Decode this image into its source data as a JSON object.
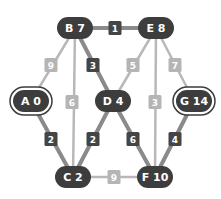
{
  "colors": {
    "node_fill": "#3d3d3d",
    "node_text": "#ffffff",
    "edge_light": "#b8b8b8",
    "edge_dark": "#8a8a8a",
    "weight_light_fill": "#b5b5b5",
    "weight_dark_fill": "#454545",
    "background": "#ffffff"
  },
  "nodes": [
    {
      "id": "B",
      "label": "B 7",
      "x": 75,
      "y": 28,
      "w": 36,
      "special": false
    },
    {
      "id": "E",
      "label": "E 8",
      "x": 156,
      "y": 28,
      "w": 36,
      "special": false
    },
    {
      "id": "A",
      "label": "A 0",
      "x": 31,
      "y": 101,
      "w": 36,
      "special": true
    },
    {
      "id": "D",
      "label": "D 4",
      "x": 113,
      "y": 101,
      "w": 36,
      "special": false
    },
    {
      "id": "G",
      "label": "G 14",
      "x": 194,
      "y": 101,
      "w": 36,
      "special": true
    },
    {
      "id": "C",
      "label": "C 2",
      "x": 73,
      "y": 177,
      "w": 36,
      "special": false
    },
    {
      "id": "F",
      "label": "F 10",
      "x": 155,
      "y": 177,
      "w": 36,
      "special": false
    }
  ],
  "edges": [
    {
      "from": "B",
      "to": "E",
      "weight": "1",
      "highlighted": true,
      "wx": 115,
      "wy": 28
    },
    {
      "from": "B",
      "to": "A",
      "weight": "9",
      "highlighted": false,
      "wx": 51,
      "wy": 65
    },
    {
      "from": "B",
      "to": "C",
      "weight": "6",
      "highlighted": false,
      "wx": 72,
      "wy": 102
    },
    {
      "from": "B",
      "to": "D",
      "weight": "3",
      "highlighted": true,
      "wx": 93,
      "wy": 65
    },
    {
      "from": "E",
      "to": "D",
      "weight": "5",
      "highlighted": false,
      "wx": 133,
      "wy": 65
    },
    {
      "from": "E",
      "to": "F",
      "weight": "3",
      "highlighted": false,
      "wx": 155,
      "wy": 102
    },
    {
      "from": "E",
      "to": "G",
      "weight": "7",
      "highlighted": false,
      "wx": 175,
      "wy": 65
    },
    {
      "from": "A",
      "to": "C",
      "weight": "2",
      "highlighted": true,
      "wx": 51,
      "wy": 139
    },
    {
      "from": "D",
      "to": "C",
      "weight": "2",
      "highlighted": true,
      "wx": 93,
      "wy": 139
    },
    {
      "from": "D",
      "to": "F",
      "weight": "6",
      "highlighted": true,
      "wx": 133,
      "wy": 139
    },
    {
      "from": "G",
      "to": "F",
      "weight": "4",
      "highlighted": true,
      "wx": 175,
      "wy": 139
    },
    {
      "from": "C",
      "to": "F",
      "weight": "9",
      "highlighted": false,
      "wx": 114,
      "wy": 177
    }
  ]
}
